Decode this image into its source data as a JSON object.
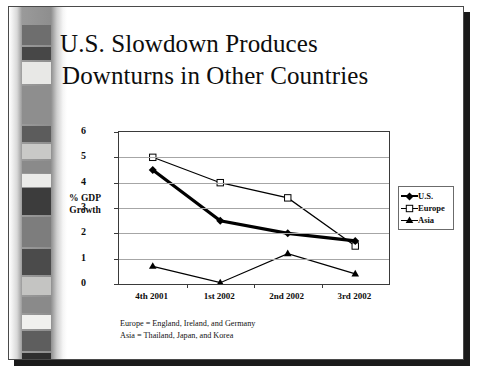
{
  "slide": {
    "title_line1": "U.S. Slowdown Produces",
    "title_line2": "Downturns in Other Countries",
    "notes": [
      "Europe = England, Ireland, and Germany",
      "Asia = Thailand, Japan, and Korea"
    ]
  },
  "axis": {
    "y_title_line1": "% GDP",
    "y_title_line2": "Growth"
  },
  "legend": {
    "title": "",
    "items": [
      {
        "label": "U.S.",
        "marker": "filled-diamond-marker",
        "color": "#000000"
      },
      {
        "label": "Europe",
        "marker": "open-square-marker",
        "color": "#000000"
      },
      {
        "label": "Asia",
        "marker": "filled-triangle-marker",
        "color": "#000000"
      }
    ]
  },
  "chart_data": {
    "type": "line",
    "title": "",
    "xlabel": "",
    "ylabel": "% GDP Growth",
    "categories": [
      "4th 2001",
      "1st 2002",
      "2nd 2002",
      "3rd 2002"
    ],
    "yticks": [
      0,
      1,
      2,
      3,
      4,
      5,
      6
    ],
    "ylim": [
      0,
      6
    ],
    "grid": "horizontal",
    "legend_position": "right",
    "series": [
      {
        "name": "U.S.",
        "values": [
          4.5,
          2.5,
          2.0,
          1.7
        ],
        "marker": "filled-diamond-marker",
        "color": "#000000",
        "linewidth": "thick"
      },
      {
        "name": "Europe",
        "values": [
          5.0,
          4.0,
          3.4,
          1.5
        ],
        "marker": "open-square-marker",
        "color": "#000000",
        "linewidth": "thin"
      },
      {
        "name": "Asia",
        "values": [
          0.7,
          0.05,
          1.2,
          0.4
        ],
        "marker": "filled-triangle-marker",
        "color": "#000000",
        "linewidth": "thin"
      }
    ]
  },
  "decoration": {
    "strip_blocks": [
      {
        "top": 18,
        "height": 20,
        "color": "#6e6e6e"
      },
      {
        "top": 40,
        "height": 13,
        "color": "#474747"
      },
      {
        "top": 55,
        "height": 22,
        "color": "#e8e8e6"
      },
      {
        "top": 79,
        "height": 38,
        "color": "#8e8e8e"
      },
      {
        "top": 119,
        "height": 16,
        "color": "#5c5c5c"
      },
      {
        "top": 137,
        "height": 15,
        "color": "#c9c9c7"
      },
      {
        "top": 154,
        "height": 12,
        "color": "#8a8a8a"
      },
      {
        "top": 167,
        "height": 13,
        "color": "#ebebe9"
      },
      {
        "top": 181,
        "height": 27,
        "color": "#3c3c3c"
      },
      {
        "top": 210,
        "height": 30,
        "color": "#7d7d7d"
      },
      {
        "top": 242,
        "height": 26,
        "color": "#4b4b4b"
      },
      {
        "top": 270,
        "height": 18,
        "color": "#c4c4c2"
      },
      {
        "top": 290,
        "height": 16,
        "color": "#8a8a8a"
      },
      {
        "top": 308,
        "height": 14,
        "color": "#f0f0ee"
      },
      {
        "top": 324,
        "height": 20,
        "color": "#5e5e5e"
      },
      {
        "top": 346,
        "height": 8,
        "color": "#2e2e2e"
      }
    ]
  }
}
